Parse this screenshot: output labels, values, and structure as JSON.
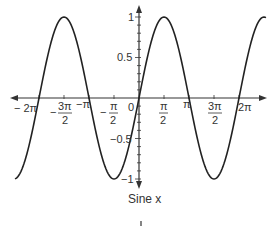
{
  "chart_data": {
    "type": "line",
    "title": "",
    "caption": "Sine x",
    "xlabel": "",
    "ylabel": "",
    "function": "sin(x)",
    "xlim": [
      -6.75,
      7.9
    ],
    "ylim": [
      -1,
      1
    ],
    "x_ticks": [
      {
        "value": -6.2832,
        "label": "−2π"
      },
      {
        "value": -4.7124,
        "label": "−3π/2"
      },
      {
        "value": -3.1416,
        "label": "−π"
      },
      {
        "value": -1.5708,
        "label": "−π/2"
      },
      {
        "value": 0,
        "label": "0"
      },
      {
        "value": 1.5708,
        "label": "π/2"
      },
      {
        "value": 3.1416,
        "label": "π"
      },
      {
        "value": 4.7124,
        "label": "3π/2"
      },
      {
        "value": 6.2832,
        "label": "2π"
      }
    ],
    "y_ticks": [
      {
        "value": 1,
        "label": "1"
      },
      {
        "value": 0.5,
        "label": "0.5"
      },
      {
        "value": -0.5,
        "label": "−0.5"
      },
      {
        "value": -1,
        "label": "−1"
      }
    ],
    "series": [
      {
        "name": "sin x",
        "x": [
          -7.5,
          -6.2832,
          -4.7124,
          -3.1416,
          -1.5708,
          0,
          1.5708,
          3.1416,
          4.7124,
          6.2832,
          7.854
        ],
        "values": [
          -0.94,
          0,
          1,
          0,
          -1,
          0,
          1,
          0,
          -1,
          0,
          1
        ]
      }
    ],
    "grid": false,
    "legend": null
  },
  "labels": {
    "caption": "Sine x",
    "x_neg_2pi": "− 2π",
    "x_neg_3pi2_prefix": "−",
    "x_neg_3pi2_num": "3π",
    "x_neg_3pi2_den": "2",
    "x_neg_pi": "−π",
    "x_neg_pi2_prefix": "−",
    "x_neg_pi2_num": "π",
    "x_neg_pi2_den": "2",
    "x_zero": "0",
    "x_pi2_num": "π",
    "x_pi2_den": "2",
    "x_pi": "π",
    "x_3pi2_num": "3π",
    "x_3pi2_den": "2",
    "x_2pi": "2π",
    "y_1": "1",
    "y_05": "0.5",
    "y_neg05": "−0.5",
    "y_neg1": "−1"
  },
  "colors": {
    "curve": "#222222",
    "axis": "#333333",
    "text": "#333333"
  }
}
